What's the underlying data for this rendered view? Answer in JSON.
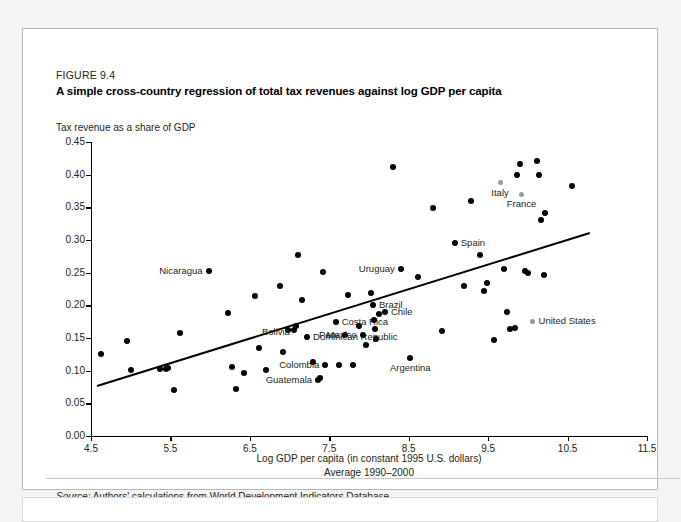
{
  "figure": {
    "number": "FIGURE 9.4",
    "title": "A simple cross-country regression of total tax revenues against log GDP per capita",
    "source_prefix": "Source:",
    "source_text": "Authors' calculations from World Development Indicators Database."
  },
  "chart_data": {
    "type": "scatter",
    "title": "A simple cross-country regression of total tax revenues against log GDP per capita",
    "ylabel": "Tax revenue as a share of GDP",
    "xlabel": "Log GDP per capita (in constant 1995 U.S. dollars)",
    "xlabel_line2": "Average 1990–2000",
    "xlim": [
      4.5,
      11.5
    ],
    "ylim": [
      0.0,
      0.45
    ],
    "xticks": [
      "4.5",
      "5.5",
      "6.5",
      "7.5",
      "8.5",
      "9.5",
      "10.5",
      "11.5"
    ],
    "xtick_values": [
      4.5,
      5.5,
      6.5,
      7.5,
      8.5,
      9.5,
      10.5,
      11.5
    ],
    "yticks": [
      "0.00",
      "0.05",
      "0.10",
      "0.15",
      "0.20",
      "0.25",
      "0.30",
      "0.35",
      "0.40",
      "0.45"
    ],
    "ytick_values": [
      0.0,
      0.05,
      0.1,
      0.15,
      0.2,
      0.25,
      0.3,
      0.35,
      0.4,
      0.45
    ],
    "grid": false,
    "legend": "none",
    "marker_color": "#000000",
    "highlight_marker_color": "#9a9a9a",
    "trendline": {
      "x0": 4.58,
      "y0": 0.078,
      "x1": 10.78,
      "y1": 0.312,
      "color": "#000000"
    },
    "points": [
      {
        "x": 4.63,
        "y": 0.126,
        "label": null
      },
      {
        "x": 4.95,
        "y": 0.146,
        "label": null
      },
      {
        "x": 5.0,
        "y": 0.101,
        "label": null
      },
      {
        "x": 5.37,
        "y": 0.102,
        "label": null
      },
      {
        "x": 5.44,
        "y": 0.103,
        "label": null
      },
      {
        "x": 5.47,
        "y": 0.104,
        "label": null
      },
      {
        "x": 5.55,
        "y": 0.071,
        "label": null
      },
      {
        "x": 5.62,
        "y": 0.158,
        "label": null
      },
      {
        "x": 5.98,
        "y": 0.253,
        "label": "Nicaragua",
        "pos": "left"
      },
      {
        "x": 6.22,
        "y": 0.189,
        "label": null
      },
      {
        "x": 6.28,
        "y": 0.105,
        "label": null
      },
      {
        "x": 6.33,
        "y": 0.072,
        "label": null
      },
      {
        "x": 6.42,
        "y": 0.096,
        "label": null
      },
      {
        "x": 6.56,
        "y": 0.215,
        "label": null
      },
      {
        "x": 6.62,
        "y": 0.135,
        "label": null
      },
      {
        "x": 6.7,
        "y": 0.101,
        "label": null
      },
      {
        "x": 6.88,
        "y": 0.23,
        "label": null
      },
      {
        "x": 6.92,
        "y": 0.129,
        "label": null
      },
      {
        "x": 6.98,
        "y": 0.163,
        "label": null
      },
      {
        "x": 7.05,
        "y": 0.162,
        "label": null
      },
      {
        "x": 7.08,
        "y": 0.168,
        "label": "Bolivia",
        "pos": "left-low"
      },
      {
        "x": 7.1,
        "y": 0.277,
        "label": null
      },
      {
        "x": 7.16,
        "y": 0.208,
        "label": null
      },
      {
        "x": 7.22,
        "y": 0.152,
        "label": "Dominican Republic",
        "pos": "right"
      },
      {
        "x": 7.3,
        "y": 0.113,
        "label": null
      },
      {
        "x": 7.36,
        "y": 0.086,
        "label": "Guatemala",
        "pos": "left"
      },
      {
        "x": 7.38,
        "y": 0.089,
        "label": null
      },
      {
        "x": 7.42,
        "y": 0.251,
        "label": null
      },
      {
        "x": 7.45,
        "y": 0.108,
        "label": "Colombia",
        "pos": "left"
      },
      {
        "x": 7.58,
        "y": 0.175,
        "label": "Costa Rica",
        "pos": "right"
      },
      {
        "x": 7.62,
        "y": 0.108,
        "label": null
      },
      {
        "x": 7.7,
        "y": 0.154,
        "label": "Peru",
        "pos": "left"
      },
      {
        "x": 7.74,
        "y": 0.216,
        "label": null
      },
      {
        "x": 7.8,
        "y": 0.108,
        "label": null
      },
      {
        "x": 7.88,
        "y": 0.168,
        "label": null
      },
      {
        "x": 7.92,
        "y": 0.155,
        "label": "Mexico",
        "pos": "left"
      },
      {
        "x": 7.96,
        "y": 0.14,
        "label": null
      },
      {
        "x": 8.02,
        "y": 0.219,
        "label": null
      },
      {
        "x": 8.05,
        "y": 0.2,
        "label": "Brazil",
        "pos": "right"
      },
      {
        "x": 8.06,
        "y": 0.178,
        "label": null
      },
      {
        "x": 8.07,
        "y": 0.164,
        "label": null
      },
      {
        "x": 8.09,
        "y": 0.148,
        "label": null
      },
      {
        "x": 8.12,
        "y": 0.186,
        "label": null
      },
      {
        "x": 8.2,
        "y": 0.19,
        "label": "Chile",
        "pos": "right"
      },
      {
        "x": 8.3,
        "y": 0.411,
        "label": null
      },
      {
        "x": 8.4,
        "y": 0.255,
        "label": "Uruguay",
        "pos": "left"
      },
      {
        "x": 8.52,
        "y": 0.12,
        "label": "Argentina",
        "pos": "below"
      },
      {
        "x": 8.62,
        "y": 0.244,
        "label": null
      },
      {
        "x": 8.8,
        "y": 0.349,
        "label": null
      },
      {
        "x": 8.92,
        "y": 0.16,
        "label": null
      },
      {
        "x": 9.08,
        "y": 0.296,
        "label": "Spain",
        "pos": "right"
      },
      {
        "x": 9.2,
        "y": 0.23,
        "label": null
      },
      {
        "x": 9.28,
        "y": 0.36,
        "label": null
      },
      {
        "x": 9.4,
        "y": 0.277,
        "label": null
      },
      {
        "x": 9.45,
        "y": 0.222,
        "label": null
      },
      {
        "x": 9.48,
        "y": 0.234,
        "label": null
      },
      {
        "x": 9.58,
        "y": 0.147,
        "label": null
      },
      {
        "x": 9.65,
        "y": 0.388,
        "label": "Italy",
        "pos": "below",
        "gray": true
      },
      {
        "x": 9.7,
        "y": 0.256,
        "label": null
      },
      {
        "x": 9.74,
        "y": 0.19,
        "label": null
      },
      {
        "x": 9.78,
        "y": 0.164,
        "label": null
      },
      {
        "x": 9.84,
        "y": 0.166,
        "label": null
      },
      {
        "x": 9.86,
        "y": 0.4,
        "label": null
      },
      {
        "x": 9.9,
        "y": 0.417,
        "label": null
      },
      {
        "x": 9.92,
        "y": 0.37,
        "label": "France",
        "pos": "below",
        "gray": true
      },
      {
        "x": 9.96,
        "y": 0.253,
        "label": null
      },
      {
        "x": 10.0,
        "y": 0.249,
        "label": null
      },
      {
        "x": 10.06,
        "y": 0.176,
        "label": "United States",
        "pos": "right",
        "gray": true
      },
      {
        "x": 10.12,
        "y": 0.421,
        "label": null
      },
      {
        "x": 10.14,
        "y": 0.4,
        "label": null
      },
      {
        "x": 10.16,
        "y": 0.33,
        "label": null
      },
      {
        "x": 10.2,
        "y": 0.246,
        "label": null
      },
      {
        "x": 10.22,
        "y": 0.341,
        "label": null
      },
      {
        "x": 10.55,
        "y": 0.382,
        "label": null
      }
    ]
  }
}
